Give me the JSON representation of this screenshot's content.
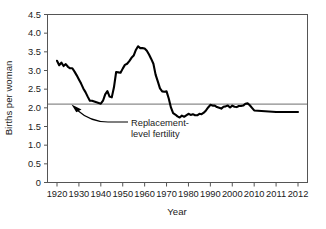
{
  "chart_data": {
    "type": "line",
    "title": "",
    "xlabel": "Year",
    "ylabel": "Births per woman",
    "xlim": [
      1920,
      2012
    ],
    "ylim": [
      0,
      4.5
    ],
    "grid": false,
    "legend_position": "none",
    "x_tick_labels": [
      "1920",
      "1930",
      "1940",
      "1950",
      "1960",
      "1970",
      "1980",
      "1990",
      "2000",
      "2010",
      "2011",
      "2012"
    ],
    "x_tick_values": [
      1920,
      1930,
      1940,
      1950,
      1960,
      1970,
      1980,
      1990,
      2000,
      2010,
      2011,
      2012
    ],
    "y_tick_labels": [
      "0",
      "0.5",
      "1.0",
      "1.5",
      "2.0",
      "2.5",
      "3.0",
      "3.5",
      "4.0",
      "4.5"
    ],
    "y_tick_values": [
      0,
      0.5,
      1.0,
      1.5,
      2.0,
      2.5,
      3.0,
      3.5,
      4.0,
      4.5
    ],
    "annotations": [
      {
        "label_line1": "Replacement-",
        "label_line2": "level fertility",
        "value": 2.1,
        "kind": "horizontal-reference-line"
      }
    ],
    "series": [
      {
        "name": "Births per woman",
        "x": [
          1920,
          1921,
          1922,
          1923,
          1924,
          1925,
          1926,
          1927,
          1928,
          1929,
          1930,
          1931,
          1932,
          1933,
          1934,
          1935,
          1936,
          1937,
          1938,
          1939,
          1940,
          1941,
          1942,
          1943,
          1944,
          1945,
          1946,
          1947,
          1948,
          1949,
          1950,
          1951,
          1952,
          1953,
          1954,
          1955,
          1956,
          1957,
          1958,
          1959,
          1960,
          1961,
          1962,
          1963,
          1964,
          1965,
          1966,
          1967,
          1968,
          1969,
          1970,
          1971,
          1972,
          1973,
          1974,
          1975,
          1976,
          1977,
          1978,
          1979,
          1980,
          1981,
          1982,
          1983,
          1984,
          1985,
          1986,
          1987,
          1988,
          1989,
          1990,
          1991,
          1992,
          1993,
          1994,
          1995,
          1996,
          1997,
          1998,
          1999,
          2000,
          2001,
          2002,
          2003,
          2004,
          2005,
          2006,
          2007,
          2008,
          2009,
          2010,
          2011,
          2012
        ],
        "values": [
          3.26,
          3.14,
          3.21,
          3.12,
          3.17,
          3.1,
          3.06,
          3.06,
          2.97,
          2.87,
          2.76,
          2.65,
          2.52,
          2.42,
          2.3,
          2.19,
          2.19,
          2.17,
          2.15,
          2.13,
          2.11,
          2.19,
          2.36,
          2.45,
          2.3,
          2.28,
          2.55,
          2.96,
          2.95,
          2.94,
          3.05,
          3.15,
          3.18,
          3.25,
          3.34,
          3.4,
          3.55,
          3.65,
          3.6,
          3.6,
          3.59,
          3.53,
          3.43,
          3.31,
          3.18,
          2.89,
          2.71,
          2.52,
          2.44,
          2.43,
          2.44,
          2.25,
          2.01,
          1.86,
          1.82,
          1.77,
          1.74,
          1.79,
          1.76,
          1.8,
          1.84,
          1.81,
          1.83,
          1.8,
          1.8,
          1.84,
          1.83,
          1.87,
          1.93,
          2.01,
          2.08,
          2.06,
          2.06,
          2.02,
          2.0,
          1.98,
          2.03,
          2.04,
          2.06,
          2.01,
          2.06,
          2.03,
          2.02,
          2.05,
          2.05,
          2.06,
          2.11,
          2.12,
          2.07,
          2.0,
          1.93,
          1.89,
          1.89
        ]
      }
    ]
  }
}
